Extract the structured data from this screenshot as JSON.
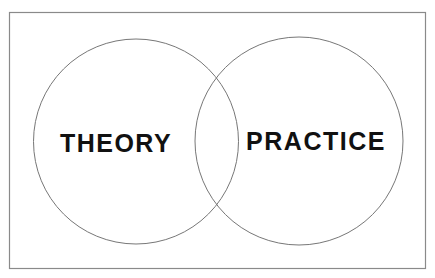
{
  "diagram": {
    "type": "venn",
    "sets": [
      {
        "label": "THEORY"
      },
      {
        "label": "PRACTICE"
      }
    ],
    "colors": {
      "background": "#ffffff",
      "border": "#8a8a8a",
      "circle_stroke": "#777777",
      "text": "#111111"
    }
  }
}
